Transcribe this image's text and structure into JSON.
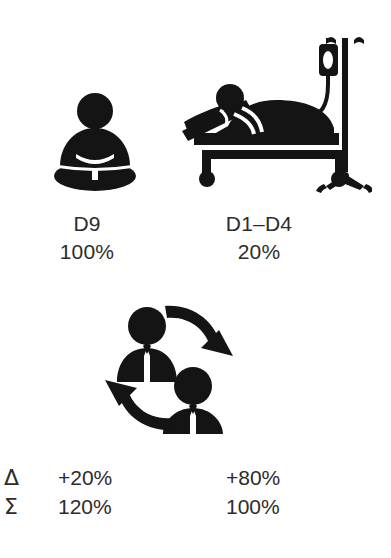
{
  "page": {
    "background_color": "#ffffff",
    "ink_color": "#141414",
    "text_color": "#2c2c2c"
  },
  "pictograms": [
    {
      "icon": "meditating-person-icon",
      "name": "D9",
      "value": "100%"
    },
    {
      "icon": "patient-in-hospital-bed-with-iv-drip-icon",
      "name": "D1–D4",
      "value": "20%"
    }
  ],
  "cycle": {
    "icon": "two-people-exchange-cycle-icon"
  },
  "summary": {
    "rows": [
      {
        "symbol": "Δ",
        "symbol_name": "delta",
        "left_value": "+20%",
        "right_value": "+80%"
      },
      {
        "symbol": "Σ",
        "symbol_name": "sigma",
        "left_value": "120%",
        "right_value": "100%"
      }
    ]
  }
}
